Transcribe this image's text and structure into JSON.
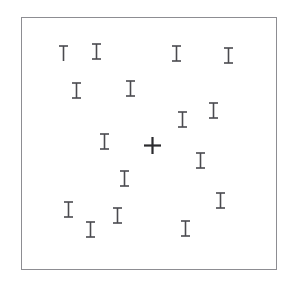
{
  "stimulus": {
    "kind": "visual-search-display",
    "background_color": "#ffffff",
    "canvas": {
      "width": 298,
      "height": 291
    },
    "frame": {
      "label": "search-display-frame",
      "x": 21,
      "y": 17,
      "width": 256,
      "height": 253,
      "border_color": "#8d8d92",
      "border_width": 1,
      "fill_color": "#ffffff"
    },
    "item_defaults": {
      "stroke_color": "#4a4a4f",
      "stroke_width": 1.6,
      "stem_height": 15,
      "serif_width": 9
    },
    "target": {
      "glyph": "plus",
      "label": "target-plus",
      "stroke_color": "#2b2b2e",
      "stroke_width": 2.2,
      "arm_length": 17,
      "count": 1
    },
    "counts": {
      "total_items": 16,
      "distractor_i": 14,
      "distractor_t": 1,
      "target_plus": 1
    },
    "items": [
      {
        "id": 1,
        "glyph": "T",
        "name": "distractor-t-1",
        "x": 63,
        "y": 53
      },
      {
        "id": 2,
        "glyph": "I",
        "name": "distractor-i-1",
        "x": 96,
        "y": 51
      },
      {
        "id": 3,
        "glyph": "I",
        "name": "distractor-i-2",
        "x": 176,
        "y": 53
      },
      {
        "id": 4,
        "glyph": "I",
        "name": "distractor-i-3",
        "x": 228,
        "y": 55
      },
      {
        "id": 5,
        "glyph": "I",
        "name": "distractor-i-4",
        "x": 76,
        "y": 90
      },
      {
        "id": 6,
        "glyph": "I",
        "name": "distractor-i-5",
        "x": 130,
        "y": 88
      },
      {
        "id": 7,
        "glyph": "I",
        "name": "distractor-i-6",
        "x": 213,
        "y": 110
      },
      {
        "id": 8,
        "glyph": "I",
        "name": "distractor-i-7",
        "x": 182,
        "y": 119
      },
      {
        "id": 9,
        "glyph": "I",
        "name": "distractor-i-8",
        "x": 104,
        "y": 141
      },
      {
        "id": 10,
        "glyph": "plus",
        "name": "target-plus",
        "x": 152,
        "y": 145
      },
      {
        "id": 11,
        "glyph": "I",
        "name": "distractor-i-9",
        "x": 200,
        "y": 160
      },
      {
        "id": 12,
        "glyph": "I",
        "name": "distractor-i-10",
        "x": 124,
        "y": 178
      },
      {
        "id": 13,
        "glyph": "I",
        "name": "distractor-i-11",
        "x": 220,
        "y": 200
      },
      {
        "id": 14,
        "glyph": "I",
        "name": "distractor-i-12",
        "x": 68,
        "y": 209
      },
      {
        "id": 15,
        "glyph": "I",
        "name": "distractor-i-13",
        "x": 117,
        "y": 215
      },
      {
        "id": 16,
        "glyph": "I",
        "name": "distractor-i-14",
        "x": 90,
        "y": 229
      },
      {
        "id": 17,
        "glyph": "I",
        "name": "distractor-i-15",
        "x": 185,
        "y": 228
      }
    ]
  }
}
